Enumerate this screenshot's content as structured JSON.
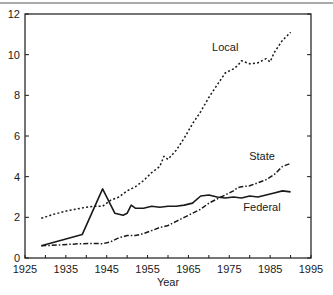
{
  "chart_data": {
    "type": "line",
    "title": "",
    "xlabel": "Year",
    "ylabel": "",
    "xlim": [
      1925,
      1995
    ],
    "ylim": [
      0,
      12
    ],
    "xticks": [
      1925,
      1935,
      1945,
      1955,
      1965,
      1975,
      1985,
      1995
    ],
    "yticks": [
      0,
      2,
      4,
      6,
      8,
      10,
      12
    ],
    "grid": false,
    "legend": "inline labels",
    "series": [
      {
        "name": "Local",
        "style": "dotted",
        "label_pos": [
          1974,
          10.2
        ],
        "x": [
          1929,
          1932,
          1936,
          1940,
          1942,
          1944,
          1946,
          1948,
          1950,
          1952,
          1954,
          1956,
          1958,
          1959,
          1960,
          1962,
          1964,
          1966,
          1968,
          1970,
          1972,
          1974,
          1976,
          1977,
          1978,
          1980,
          1982,
          1984,
          1985,
          1986,
          1987,
          1988,
          1990
        ],
        "values": [
          1.95,
          2.15,
          2.35,
          2.5,
          2.55,
          2.55,
          2.85,
          3.0,
          3.3,
          3.5,
          3.8,
          4.2,
          4.5,
          5.0,
          4.85,
          5.3,
          5.9,
          6.6,
          7.2,
          7.9,
          8.5,
          9.1,
          9.3,
          9.45,
          9.7,
          9.55,
          9.6,
          9.8,
          9.65,
          10.1,
          10.4,
          10.7,
          11.1
        ]
      },
      {
        "name": "State",
        "style": "dash-dot",
        "label_pos": [
          1983,
          4.8
        ],
        "x": [
          1929,
          1934,
          1938,
          1942,
          1944,
          1946,
          1948,
          1950,
          1952,
          1954,
          1956,
          1958,
          1960,
          1962,
          1964,
          1966,
          1968,
          1970,
          1972,
          1974,
          1976,
          1977,
          1978,
          1980,
          1982,
          1984,
          1986,
          1988,
          1990
        ],
        "values": [
          0.6,
          0.65,
          0.7,
          0.72,
          0.7,
          0.8,
          1.0,
          1.1,
          1.1,
          1.2,
          1.35,
          1.5,
          1.6,
          1.8,
          2.0,
          2.2,
          2.4,
          2.7,
          2.9,
          3.1,
          3.3,
          3.45,
          3.5,
          3.55,
          3.7,
          3.85,
          4.1,
          4.5,
          4.65
        ]
      },
      {
        "name": "Federal",
        "style": "solid",
        "label_pos": [
          1983,
          2.3
        ],
        "x": [
          1929,
          1939,
          1944,
          1947,
          1949,
          1950,
          1951,
          1952,
          1954,
          1956,
          1958,
          1960,
          1962,
          1964,
          1966,
          1968,
          1970,
          1972,
          1974,
          1976,
          1978,
          1980,
          1982,
          1984,
          1986,
          1988,
          1990
        ],
        "values": [
          0.6,
          1.15,
          3.4,
          2.2,
          2.1,
          2.2,
          2.6,
          2.45,
          2.45,
          2.55,
          2.5,
          2.55,
          2.55,
          2.6,
          2.7,
          3.05,
          3.1,
          3.0,
          2.95,
          3.0,
          2.95,
          3.05,
          3.0,
          3.1,
          3.2,
          3.3,
          3.25
        ]
      }
    ]
  },
  "colors": {
    "ink": "#1a1a1a",
    "background": "#ffffff"
  }
}
